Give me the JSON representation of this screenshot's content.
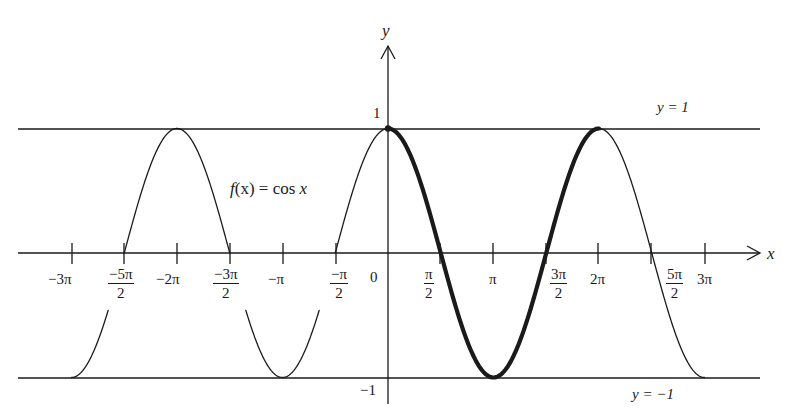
{
  "chart_data": {
    "type": "line",
    "title": "",
    "function_label": "f(x) = cos x",
    "xlabel": "x",
    "ylabel": "y",
    "xlim": [
      -9.42,
      9.42
    ],
    "ylim": [
      -1,
      1
    ],
    "grid": false,
    "x_ticks": [
      {
        "value": -9.4248,
        "label": "−3π"
      },
      {
        "value": -7.854,
        "label_num": "−5π",
        "label_den": "2"
      },
      {
        "value": -6.2832,
        "label": "−2π"
      },
      {
        "value": -4.7124,
        "label_num": "−3π",
        "label_den": "2"
      },
      {
        "value": -3.1416,
        "label": "−π"
      },
      {
        "value": -1.5708,
        "label_num": "−π",
        "label_den": "2"
      },
      {
        "value": 0,
        "label": "0"
      },
      {
        "value": 1.5708,
        "label_num": "π",
        "label_den": "2"
      },
      {
        "value": 3.1416,
        "label": "π"
      },
      {
        "value": 4.7124,
        "label_num": "3π",
        "label_den": "2"
      },
      {
        "value": 6.2832,
        "label": "2π"
      },
      {
        "value": 7.854,
        "label_num": "5π",
        "label_den": "2"
      },
      {
        "value": 9.4248,
        "label": "3π"
      }
    ],
    "y_ticks": [
      {
        "value": 1,
        "label": "1"
      },
      {
        "value": -1,
        "label": "−1"
      }
    ],
    "horizontal_lines": [
      {
        "y": 1,
        "label": "y = 1"
      },
      {
        "y": -1,
        "label": "y = −1"
      }
    ],
    "series": [
      {
        "name": "cos x",
        "style": "thin",
        "x_range": [
          -9.4248,
          9.4248
        ]
      },
      {
        "name": "cos x (one period highlighted)",
        "style": "bold",
        "x_range": [
          0,
          6.2832
        ]
      }
    ],
    "sample_points": {
      "x": [
        -9.4248,
        -7.854,
        -6.2832,
        -4.7124,
        -3.1416,
        -1.5708,
        0,
        1.5708,
        3.1416,
        4.7124,
        6.2832,
        7.854,
        9.4248
      ],
      "y": [
        -1,
        0,
        1,
        0,
        -1,
        0,
        1,
        0,
        -1,
        0,
        1,
        0,
        -1
      ]
    }
  },
  "labels": {
    "y_axis": "y",
    "x_axis": "x",
    "one": "1",
    "minus_one": "−1",
    "zero": "0",
    "line_top": "y = 1",
    "line_bottom": "y = −1",
    "func_f": "f",
    "func_rest": "(x) = cos ",
    "func_x": "x",
    "t_m3pi": "−3π",
    "t_m5pi2_num": "−5π",
    "t_m2pi": "−2π",
    "t_m3pi2_num": "−3π",
    "t_mpi": "−π",
    "t_mpi2_num": "−π",
    "t_pi2_num": "π",
    "t_pi": "π",
    "t_3pi2_num": "3π",
    "t_2pi": "2π",
    "t_5pi2_num": "5π",
    "t_3pi": "3π",
    "den2": "2"
  },
  "colors": {
    "ink": "#1a1a1a",
    "background": "#ffffff"
  }
}
